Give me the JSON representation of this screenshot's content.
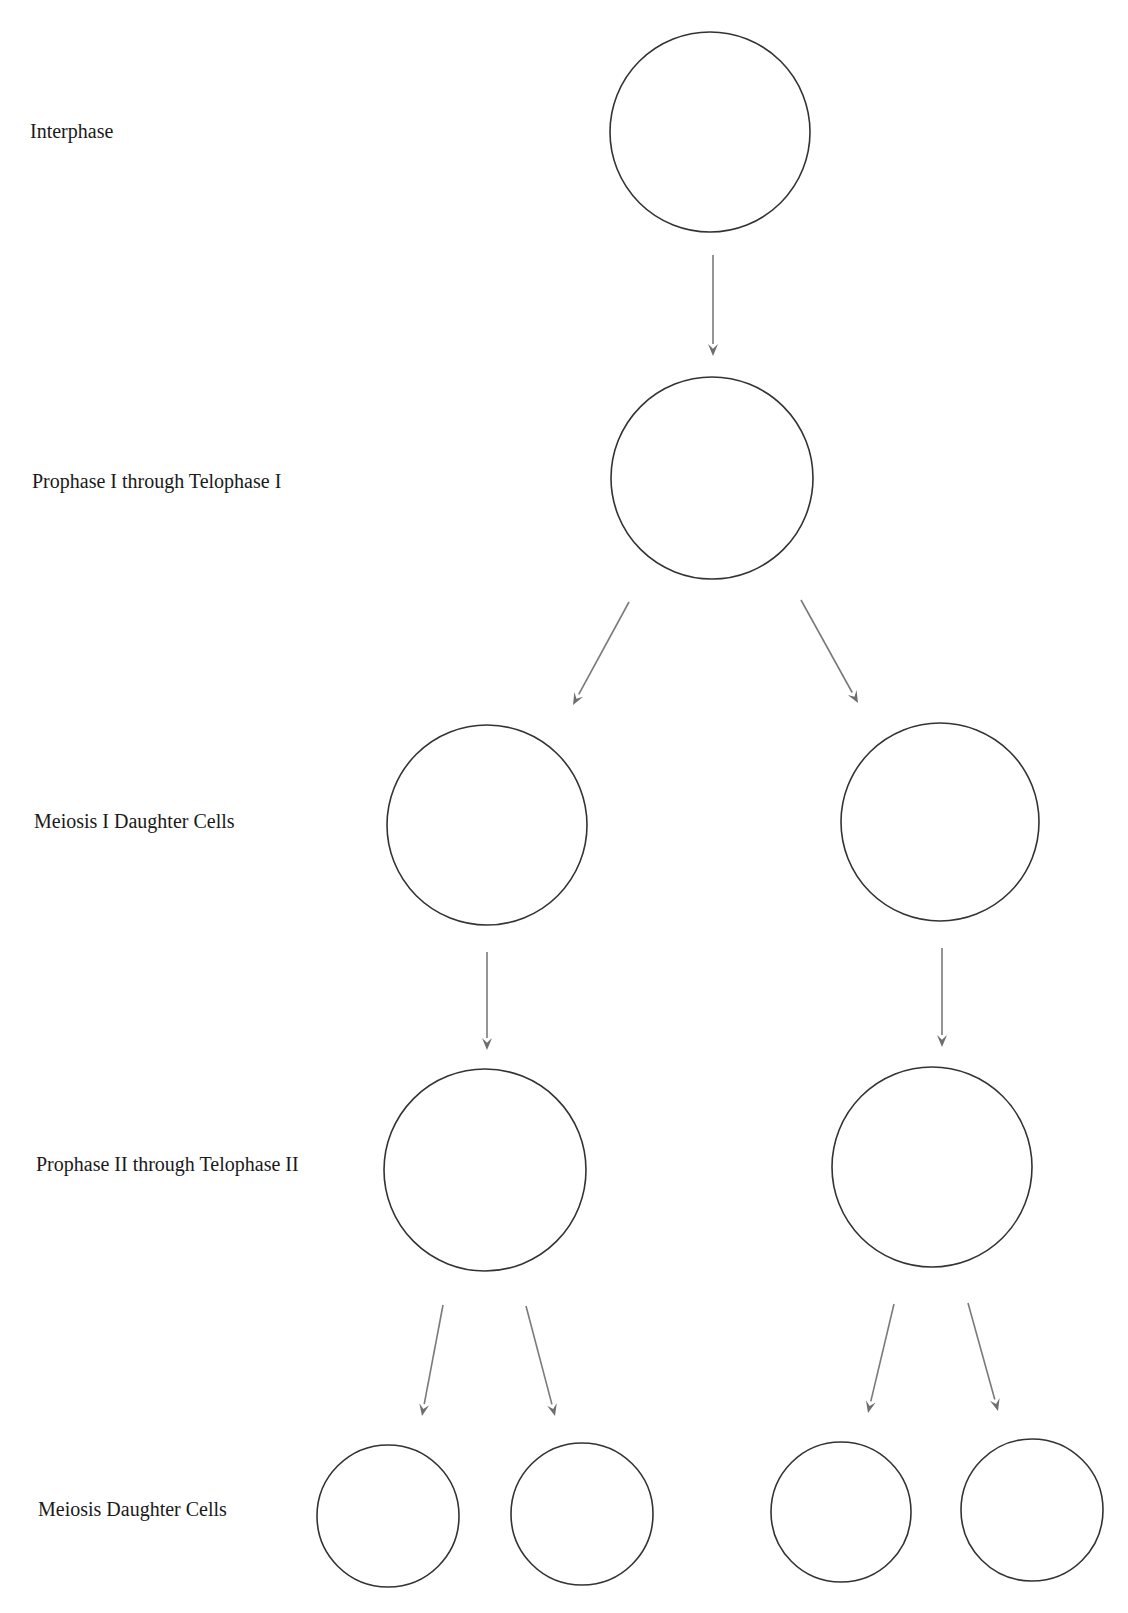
{
  "diagram": {
    "labels": [
      {
        "text": "Interphase",
        "x": 30,
        "y": 121
      },
      {
        "text": "Prophase I through Telophase I",
        "x": 32,
        "y": 471
      },
      {
        "text": "Meiosis I Daughter Cells",
        "x": 34,
        "y": 811
      },
      {
        "text": "Prophase II through Telophase II",
        "x": 36,
        "y": 1154
      },
      {
        "text": "Meiosis Daughter Cells",
        "x": 38,
        "y": 1499
      }
    ],
    "cells": [
      {
        "id": "interphase",
        "cx": 710,
        "cy": 132,
        "r": 100
      },
      {
        "id": "prophase-1",
        "cx": 712,
        "cy": 478,
        "r": 101
      },
      {
        "id": "meiosis-1-left",
        "cx": 487,
        "cy": 825,
        "r": 100
      },
      {
        "id": "meiosis-1-right",
        "cx": 940,
        "cy": 822,
        "r": 99
      },
      {
        "id": "prophase-2-left",
        "cx": 485,
        "cy": 1170,
        "r": 101
      },
      {
        "id": "prophase-2-right",
        "cx": 932,
        "cy": 1167,
        "r": 100
      },
      {
        "id": "daughter-1",
        "cx": 388,
        "cy": 1516,
        "r": 71
      },
      {
        "id": "daughter-2",
        "cx": 582,
        "cy": 1514,
        "r": 71
      },
      {
        "id": "daughter-3",
        "cx": 841,
        "cy": 1512,
        "r": 70
      },
      {
        "id": "daughter-4",
        "cx": 1032,
        "cy": 1510,
        "r": 71
      }
    ],
    "arrows": [
      {
        "from": [
          713,
          255
        ],
        "to": [
          713,
          356
        ]
      },
      {
        "from": [
          629,
          602
        ],
        "to": [
          573,
          705
        ]
      },
      {
        "from": [
          801,
          600
        ],
        "to": [
          858,
          703
        ]
      },
      {
        "from": [
          487,
          952
        ],
        "to": [
          487,
          1050
        ]
      },
      {
        "from": [
          942,
          948
        ],
        "to": [
          942,
          1047
        ]
      },
      {
        "from": [
          443,
          1305
        ],
        "to": [
          422,
          1416
        ]
      },
      {
        "from": [
          526,
          1306
        ],
        "to": [
          555,
          1416
        ]
      },
      {
        "from": [
          894,
          1304
        ],
        "to": [
          868,
          1413
        ]
      },
      {
        "from": [
          968,
          1303
        ],
        "to": [
          998,
          1411
        ]
      }
    ],
    "colors": {
      "cell_stroke": "#333333",
      "arrow": "#7a7a7a",
      "label": "#1a1a1a",
      "background": "#ffffff"
    }
  }
}
